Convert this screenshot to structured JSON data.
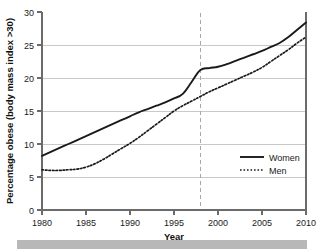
{
  "chart_data": {
    "type": "line",
    "title": "",
    "xlabel": "Year",
    "ylabel": "Percentage obese (body mass index >30)",
    "xlim": [
      1980,
      2010
    ],
    "ylim": [
      0,
      30
    ],
    "xticks": [
      1980,
      1985,
      1990,
      1995,
      2000,
      2005,
      2010
    ],
    "xtick_labels": [
      "1980",
      "1985",
      "1990",
      "1995",
      "2000",
      "2005",
      "2010"
    ],
    "yticks": [
      0,
      5,
      10,
      15,
      20,
      25,
      30
    ],
    "ytick_labels": [
      "0",
      "5",
      "10",
      "15",
      "20",
      "25",
      "30"
    ],
    "grid": "horizontal",
    "legend_position": "lower-right",
    "x": [
      1980,
      1981,
      1982,
      1983,
      1984,
      1985,
      1986,
      1987,
      1988,
      1989,
      1990,
      1991,
      1992,
      1993,
      1994,
      1995,
      1996,
      1997,
      1998,
      1999,
      2000,
      2001,
      2002,
      2003,
      2004,
      2005,
      2006,
      2007,
      2008,
      2009,
      2010
    ],
    "series": [
      {
        "name": "Women",
        "style": "solid",
        "color": "#1a1a1a",
        "values": [
          8.2,
          8.8,
          9.4,
          10.0,
          10.6,
          11.2,
          11.8,
          12.4,
          13.0,
          13.6,
          14.2,
          14.8,
          15.3,
          15.8,
          16.3,
          16.9,
          17.6,
          19.4,
          21.2,
          21.5,
          21.7,
          22.1,
          22.6,
          23.1,
          23.6,
          24.1,
          24.7,
          25.3,
          26.2,
          27.3,
          28.4
        ]
      },
      {
        "name": "Men",
        "style": "dotted",
        "color": "#1a1a1a",
        "values": [
          6.1,
          6.0,
          6.0,
          6.1,
          6.2,
          6.5,
          7.0,
          7.7,
          8.5,
          9.3,
          10.1,
          11.0,
          12.0,
          13.0,
          14.0,
          15.0,
          15.8,
          16.5,
          17.2,
          17.9,
          18.5,
          19.1,
          19.7,
          20.3,
          20.9,
          21.6,
          22.5,
          23.4,
          24.3,
          25.3,
          26.2
        ]
      }
    ],
    "annotations": [
      {
        "type": "vline",
        "name": "reference-line-1998",
        "x": 1998,
        "style": "dashed",
        "color": "#a8a8a8",
        "label": ""
      }
    ]
  },
  "legend": {
    "items": [
      {
        "label": "Women",
        "style": "solid"
      },
      {
        "label": "Men",
        "style": "dotted"
      }
    ]
  },
  "colors": {
    "axis": "#6b6b6b",
    "grid": "#c9c9c9",
    "series": "#1a1a1a",
    "reference_line": "#a8a8a8",
    "footer_bar": "#b8b8b8"
  }
}
